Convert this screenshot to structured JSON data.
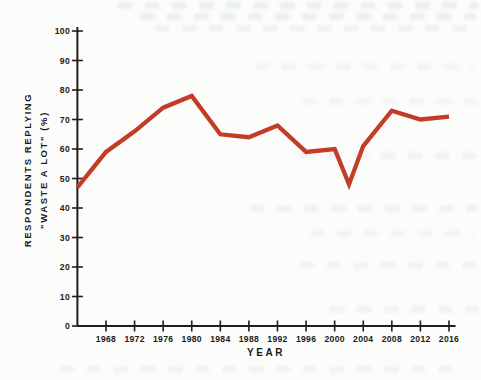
{
  "figure": {
    "background_color": "#fcfcfb",
    "axis_color": "#1d1d1d",
    "text_color": "#1b1b1b",
    "line_color": "#c23d27"
  },
  "chart_data": {
    "type": "line",
    "title": "",
    "xlabel": "YEAR",
    "ylabel": "RESPONDENTS REPLYING \"WASTE A LOT\" (%)",
    "ylabel_lines": [
      "RESPONDENTS REPLYING",
      "\"WASTE A LOT\" (%)"
    ],
    "series": [
      {
        "name": "percent-replying-waste-a-lot",
        "x": [
          1964,
          1968,
          1972,
          1976,
          1980,
          1984,
          1988,
          1992,
          1996,
          2000,
          2002,
          2004,
          2008,
          2012,
          2016
        ],
        "y": [
          47,
          59,
          66,
          74,
          78,
          65,
          64,
          68,
          59,
          60,
          48,
          61,
          73,
          70,
          71
        ]
      }
    ],
    "xticks": [
      1968,
      1972,
      1976,
      1980,
      1984,
      1988,
      1992,
      1996,
      2000,
      2004,
      2008,
      2012,
      2016
    ],
    "yticks": [
      0,
      10,
      20,
      30,
      40,
      50,
      60,
      70,
      80,
      90,
      100
    ],
    "xlim": [
      1964,
      2016
    ],
    "ylim": [
      0,
      100
    ],
    "grid": false,
    "legend": false
  }
}
